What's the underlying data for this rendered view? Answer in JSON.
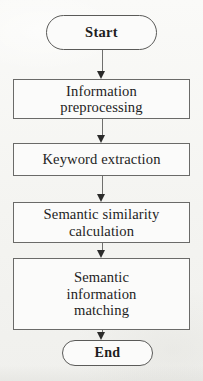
{
  "diagram": {
    "orientation": "vertical top-to-bottom",
    "background_color": "#f6f6f4",
    "node_fill_color": "#fbfbfa",
    "node_border_color": "#6a6a68",
    "text_color": "#1e1e1e",
    "arrow_color": "#2b2b2a",
    "nodes": [
      {
        "id": "start",
        "shape": "terminator",
        "label": "Start"
      },
      {
        "id": "preprocessing",
        "shape": "process",
        "label": "Information\npreprocessing"
      },
      {
        "id": "keyword",
        "shape": "process",
        "label": "Keyword extraction"
      },
      {
        "id": "similarity",
        "shape": "process",
        "label": "Semantic similarity\ncalculation"
      },
      {
        "id": "matching",
        "shape": "process",
        "label": "Semantic\ninformation\nmatching"
      },
      {
        "id": "end",
        "shape": "terminator",
        "label": "End"
      }
    ],
    "edges": [
      {
        "id": "e1",
        "from": "start",
        "to": "preprocessing",
        "arrow": "down-arrow-icon"
      },
      {
        "id": "e2",
        "from": "preprocessing",
        "to": "keyword",
        "arrow": "down-arrow-icon"
      },
      {
        "id": "e3",
        "from": "keyword",
        "to": "similarity",
        "arrow": "down-arrow-icon"
      },
      {
        "id": "e4",
        "from": "similarity",
        "to": "matching",
        "arrow": "down-arrow-icon"
      },
      {
        "id": "e5",
        "from": "matching",
        "to": "end",
        "arrow": "down-arrow-icon"
      }
    ]
  }
}
